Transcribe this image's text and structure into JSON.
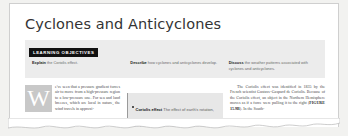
{
  "document": {
    "title": "Cyclones and Anticyclones"
  },
  "learning_objectives": {
    "banner_label": "LEARNING OBJECTIVES",
    "items": [
      {
        "verb": "Explain",
        "text": " the Coriolis effect."
      },
      {
        "verb": "Describe",
        "text": " how cyclones and anticyclones develop."
      },
      {
        "verb": "Discuss",
        "text": " the weather patterns associated with cyclones and anticyclones."
      }
    ]
  },
  "body": {
    "left_column": {
      "dropcap": "W",
      "text": "e've seen that a pressure gradient forces air to move from a high-pressure region to a low-pressure one. For sea and land breezes, which are local in nature, the wind travels in approxi-"
    },
    "callout": {
      "term": "Coriolis effect",
      "definition": " The effect of earth's rotation, which acts like a force to deflect a moving object on the"
    },
    "right_column": {
      "text_before_figref": "The Coriolis effect was identified in 1835 by the French scientist Gustave-Gaspard de Coriolis. Because of the Coriolis effect, an object in the Northern Hemisphere moves as if a force were pulling it to the right (",
      "figure_reference": "FIGURE 15.9B",
      "text_after_figref": "). In the South-"
    }
  },
  "colors": {
    "banner_background": "#111111",
    "band_background": "#ececec",
    "callout_background": "#e7e7e7",
    "dropcap_background": "#c8c8c8",
    "paper_background": "#ffffff",
    "scan_background": "#f2f2f0"
  }
}
